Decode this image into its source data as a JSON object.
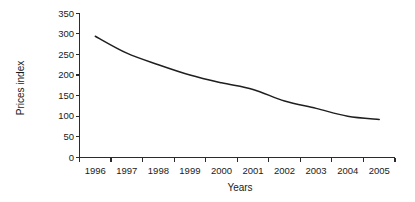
{
  "chart_data": {
    "type": "line",
    "title": "",
    "xlabel": "Years",
    "ylabel": "Prices index",
    "categories": [
      "1996",
      "1997",
      "1998",
      "1999",
      "2000",
      "2001",
      "2002",
      "2003",
      "2004",
      "2005"
    ],
    "values": [
      294,
      253,
      225,
      200,
      181,
      165,
      137,
      119,
      100,
      92
    ],
    "series": [
      {
        "name": "Prices index",
        "values": [
          294,
          253,
          225,
          200,
          181,
          165,
          137,
          119,
          100,
          92
        ],
        "color": "#1f1f1f"
      }
    ],
    "ylim": [
      0,
      350
    ],
    "y_ticks": [
      0,
      50,
      100,
      150,
      200,
      250,
      300,
      350
    ],
    "y_tick_labels": [
      "0",
      "50",
      "100",
      "150",
      "200",
      "250",
      "300",
      "350"
    ],
    "x_tick_labels": [
      "1996",
      "1997",
      "1998",
      "1999",
      "2000",
      "2001",
      "2002",
      "2003",
      "2004",
      "2005"
    ],
    "grid": false,
    "legend": false,
    "legend_position": "none",
    "line_color": "#1f1f1f",
    "axis_color": "#2b2b2b",
    "background_color": "#ffffff"
  }
}
